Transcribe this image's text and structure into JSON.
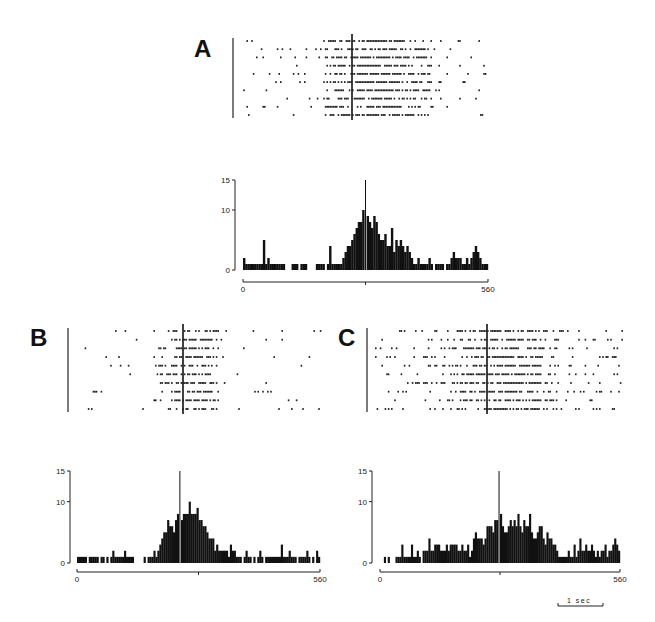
{
  "figure": {
    "panels": [
      {
        "id": "A",
        "label": "A"
      },
      {
        "id": "B",
        "label": "B"
      },
      {
        "id": "C",
        "label": "C"
      }
    ],
    "scale_bar": {
      "label": "1 sec"
    }
  },
  "chart_data": [
    {
      "panel": "A",
      "type": "raster",
      "rows": 10,
      "title": "",
      "description": "Spike raster, 10 trials, aligned to vertical trigger line near center; dense firing just after trigger"
    },
    {
      "panel": "A",
      "type": "bar",
      "title": "",
      "xlabel": "",
      "ylabel": "",
      "xlim": [
        0,
        560
      ],
      "ylim": [
        0,
        15
      ],
      "yticks": [
        0,
        10,
        15
      ],
      "xticks": [
        "0",
        "560"
      ],
      "bins": 100,
      "values": [
        2,
        1,
        1,
        1,
        1,
        1,
        1,
        1,
        1,
        5,
        1,
        2,
        1,
        1,
        1,
        1,
        1,
        1,
        1,
        0,
        0,
        0,
        1,
        1,
        1,
        0,
        1,
        1,
        1,
        0,
        0,
        0,
        0,
        1,
        1,
        1,
        1,
        0,
        1,
        4,
        1,
        1,
        1,
        1,
        1,
        2,
        3,
        4,
        4,
        5,
        6,
        7,
        8,
        8,
        10,
        15,
        9,
        8,
        7,
        9,
        8,
        6,
        5,
        5,
        6,
        4,
        4,
        7,
        3,
        5,
        4,
        5,
        4,
        3,
        4,
        3,
        2,
        1,
        1,
        2,
        1,
        1,
        1,
        1,
        2,
        1,
        0,
        1,
        1,
        1,
        1,
        0,
        1,
        1,
        2,
        3,
        2,
        2,
        2,
        1,
        1,
        2,
        1,
        2,
        3,
        4,
        3,
        2,
        1,
        1,
        1
      ]
    },
    {
      "panel": "B",
      "type": "raster",
      "rows": 10,
      "description": "Spike raster, 10 trials, aligned to vertical trigger line"
    },
    {
      "panel": "B",
      "type": "bar",
      "xlim": [
        0,
        560
      ],
      "ylim": [
        0,
        15
      ],
      "yticks": [
        0,
        10,
        15
      ],
      "xticks": [
        "0",
        "560"
      ],
      "bins": 100,
      "values": [
        1,
        1,
        1,
        1,
        1,
        0,
        1,
        1,
        1,
        1,
        1,
        0,
        1,
        1,
        0,
        1,
        0,
        1,
        2,
        1,
        1,
        1,
        1,
        1,
        2,
        1,
        1,
        1,
        1,
        0,
        0,
        0,
        0,
        0,
        1,
        0,
        1,
        1,
        1,
        2,
        1,
        2,
        3,
        4,
        5,
        5,
        7,
        6,
        6,
        5,
        7,
        8,
        15,
        7,
        8,
        8,
        8,
        10,
        8,
        8,
        8,
        9,
        7,
        7,
        6,
        6,
        5,
        4,
        4,
        4,
        2,
        3,
        2,
        2,
        2,
        2,
        2,
        1,
        3,
        2,
        2,
        1,
        1,
        1,
        0,
        1,
        2,
        1,
        1,
        0,
        1,
        0,
        1,
        2,
        1,
        0,
        1,
        1,
        1,
        1,
        1,
        1,
        1,
        1,
        3,
        1,
        1,
        1,
        2,
        1,
        1,
        1,
        0,
        1,
        1,
        1,
        1,
        2,
        1,
        0,
        1,
        0,
        2,
        1
      ]
    },
    {
      "panel": "C",
      "type": "raster",
      "rows": 10,
      "description": "Spike raster, 10 trials, aligned to vertical trigger line; higher background firing"
    },
    {
      "panel": "C",
      "type": "bar",
      "xlim": [
        0,
        560
      ],
      "ylim": [
        0,
        15
      ],
      "yticks": [
        0,
        10,
        15
      ],
      "xticks": [
        "0",
        "560"
      ],
      "bins": 100,
      "values": [
        0,
        0,
        1,
        0,
        1,
        0,
        0,
        0,
        1,
        1,
        1,
        3,
        1,
        1,
        1,
        1,
        3,
        1,
        1,
        2,
        1,
        0,
        2,
        2,
        2,
        4,
        2,
        2,
        3,
        3,
        3,
        2,
        2,
        2,
        3,
        2,
        3,
        3,
        3,
        3,
        2,
        2,
        3,
        2,
        2,
        3,
        1,
        2,
        4,
        5,
        4,
        4,
        4,
        3,
        4,
        6,
        6,
        6,
        5,
        7,
        7,
        15,
        8,
        6,
        5,
        5,
        6,
        7,
        6,
        7,
        6,
        8,
        6,
        5,
        7,
        6,
        6,
        8,
        5,
        4,
        4,
        5,
        6,
        6,
        4,
        3,
        5,
        4,
        4,
        3,
        3,
        2,
        1,
        1,
        1,
        1,
        1,
        2,
        1,
        1,
        3,
        1,
        2,
        4,
        2,
        2,
        3,
        2,
        2,
        3,
        2,
        1,
        2,
        1,
        2,
        2,
        3,
        1,
        2,
        2,
        3,
        4,
        3,
        2
      ]
    }
  ]
}
